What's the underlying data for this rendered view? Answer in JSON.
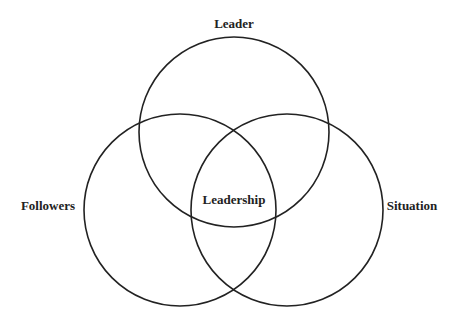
{
  "diagram": {
    "type": "venn",
    "stroke_color": "#222222",
    "circles": [
      {
        "id": "leader",
        "label": "Leader",
        "cx": 234,
        "cy": 132,
        "r": 95
      },
      {
        "id": "followers",
        "label": "Followers",
        "cx": 180,
        "cy": 210,
        "r": 96
      },
      {
        "id": "situation",
        "label": "Situation",
        "cx": 287,
        "cy": 210,
        "r": 96
      }
    ],
    "labels": {
      "leader": "Leader",
      "followers": "Followers",
      "situation": "Situation",
      "center": "Leadership"
    }
  }
}
